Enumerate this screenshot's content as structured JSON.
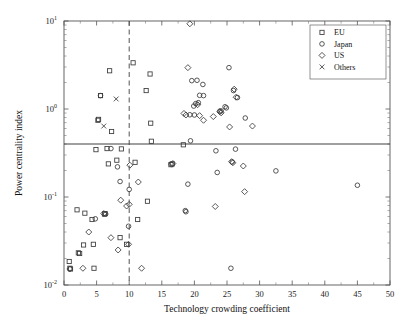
{
  "chart_data": {
    "type": "scatter",
    "title": "",
    "xlabel": "Technology crowding coefficient",
    "ylabel": "Power centrality index",
    "xlim": [
      0,
      50
    ],
    "ylim": [
      0.01,
      10
    ],
    "yscale": "log",
    "xscale": "linear",
    "grid": false,
    "xticks": [
      0,
      5,
      10,
      15,
      20,
      25,
      30,
      35,
      40,
      45,
      50
    ],
    "xticklabels": [
      "0",
      "5",
      "10",
      "15",
      "20",
      "25",
      "30",
      "35",
      "40",
      "45",
      "50"
    ],
    "yticks": [
      0.01,
      0.1,
      1,
      10
    ],
    "yticklabels": [
      "10-2",
      "10-1",
      "100",
      "101"
    ],
    "ytick_mantissas": [
      "10",
      "10",
      "10",
      "10"
    ],
    "ytick_exponents": [
      "-2",
      "-1",
      "0",
      "1"
    ],
    "legend_position": "top-right",
    "legend": [
      {
        "name": "EU",
        "marker": "square"
      },
      {
        "name": "Japan",
        "marker": "circle"
      },
      {
        "name": "US",
        "marker": "diamond"
      },
      {
        "name": "Others",
        "marker": "cross"
      }
    ],
    "annotations": [
      {
        "type": "hline",
        "label": "power centrality threshold",
        "y": 0.4,
        "style": "solid"
      },
      {
        "type": "vline",
        "label": "technology crowding threshold",
        "x": 10,
        "style": "dashed"
      }
    ],
    "series": [
      {
        "name": "EU",
        "marker": "square",
        "points": [
          [
            0.8,
            0.0185
          ],
          [
            0.9,
            0.0155
          ],
          [
            1.0,
            0.0152
          ],
          [
            2.0,
            0.0715
          ],
          [
            2.2,
            0.0232
          ],
          [
            2.4,
            0.0228
          ],
          [
            3.0,
            0.0285
          ],
          [
            3.2,
            0.0655
          ],
          [
            4.3,
            0.0555
          ],
          [
            4.5,
            0.029
          ],
          [
            4.6,
            0.0155
          ],
          [
            4.9,
            0.345
          ],
          [
            5.2,
            0.745
          ],
          [
            5.3,
            0.762
          ],
          [
            5.6,
            1.42
          ],
          [
            6.2,
            0.064
          ],
          [
            6.3,
            0.0648
          ],
          [
            6.6,
            0.355
          ],
          [
            6.8,
            0.238
          ],
          [
            7.0,
            2.72
          ],
          [
            7.3,
            0.555
          ],
          [
            8.1,
            0.262
          ],
          [
            8.6,
            0.0345
          ],
          [
            8.8,
            0.352
          ],
          [
            9.6,
            0.029
          ],
          [
            10.6,
            3.35
          ],
          [
            10.9,
            0.248
          ],
          [
            11.3,
            0.0555
          ],
          [
            12.6,
            1.62
          ],
          [
            12.8,
            0.0895
          ],
          [
            13.2,
            2.5
          ],
          [
            13.3,
            0.69
          ],
          [
            13.4,
            0.43
          ],
          [
            18.3,
            0.392
          ],
          [
            16.4,
            0.233
          ],
          [
            16.6,
            0.238
          ]
        ]
      },
      {
        "name": "Japan",
        "marker": "circle",
        "points": [
          [
            4.8,
            0.0565
          ],
          [
            5.6,
            1.42
          ],
          [
            6.4,
            0.064
          ],
          [
            7.2,
            0.355
          ],
          [
            8.2,
            0.22
          ],
          [
            8.6,
            0.15
          ],
          [
            9.9,
            0.0465
          ],
          [
            10.0,
            0.122
          ],
          [
            18.6,
            0.07
          ],
          [
            18.7,
            0.068
          ],
          [
            19.0,
            0.14
          ],
          [
            19.4,
            0.435
          ],
          [
            19.6,
            2.1
          ],
          [
            19.9,
            1.08
          ],
          [
            20.2,
            1.15
          ],
          [
            20.4,
            2.12
          ],
          [
            20.6,
            1.18
          ],
          [
            20.8,
            1.43
          ],
          [
            21.3,
            1.9
          ],
          [
            21.4,
            1.42
          ],
          [
            19.3,
            0.86
          ],
          [
            20.0,
            0.855
          ],
          [
            23.3,
            0.335
          ],
          [
            23.5,
            0.19
          ],
          [
            23.9,
            0.945
          ],
          [
            24.1,
            0.95
          ],
          [
            24.7,
            1.06
          ],
          [
            24.9,
            1.03
          ],
          [
            25.3,
            2.95
          ],
          [
            25.6,
            0.0155
          ],
          [
            25.8,
            0.25
          ],
          [
            26.0,
            1.62
          ],
          [
            26.3,
            0.35
          ],
          [
            26.6,
            1.35
          ],
          [
            27.8,
            0.79
          ],
          [
            32.5,
            0.198
          ],
          [
            45.0,
            0.136
          ]
        ]
      },
      {
        "name": "US",
        "marker": "diamond",
        "points": [
          [
            0.9,
            0.0152
          ],
          [
            2.9,
            0.0155
          ],
          [
            3.8,
            0.04
          ],
          [
            6.1,
            0.0648
          ],
          [
            7.2,
            0.0345
          ],
          [
            8.3,
            0.025
          ],
          [
            8.7,
            0.092
          ],
          [
            9.6,
            0.079
          ],
          [
            9.9,
            0.029
          ],
          [
            10.0,
            0.0825
          ],
          [
            10.1,
            0.23
          ],
          [
            11.4,
            0.148
          ],
          [
            11.9,
            0.0155
          ],
          [
            16.5,
            0.236
          ],
          [
            16.7,
            0.24
          ],
          [
            18.4,
            0.89
          ],
          [
            18.7,
            0.855
          ],
          [
            19.0,
            2.95
          ],
          [
            19.3,
            9.3
          ],
          [
            20.5,
            1.12
          ],
          [
            20.8,
            0.84
          ],
          [
            21.4,
            0.745
          ],
          [
            22.9,
            0.82
          ],
          [
            23.2,
            0.078
          ],
          [
            23.9,
            0.93
          ],
          [
            24.1,
            0.905
          ],
          [
            25.4,
            0.625
          ],
          [
            25.7,
            0.252
          ],
          [
            25.9,
            0.245
          ],
          [
            26.1,
            1.68
          ],
          [
            27.5,
            0.225
          ],
          [
            27.7,
            0.115
          ],
          [
            28.9,
            0.64
          ],
          [
            26.4,
            1.36
          ]
        ]
      },
      {
        "name": "Others",
        "marker": "cross",
        "points": [
          [
            6.1,
            0.64
          ],
          [
            8.0,
            1.3
          ]
        ]
      }
    ]
  }
}
